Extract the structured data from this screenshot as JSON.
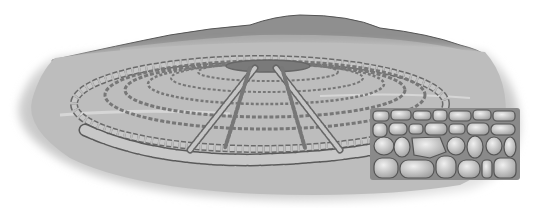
{
  "image": {
    "subject": "stone circle with radiating stone rows on plain, with close-up of dry-stone wall",
    "colors": {
      "background": "#ffffff",
      "ground": "#b9b9b9",
      "ground_light": "#cfcfcf",
      "hill": "#8f8f8f",
      "hill_far": "#a5a5a5",
      "stone": "#c4c4c4",
      "stone_outline": "#5a5a5a",
      "wall_stone": "#d2d2d2"
    }
  }
}
